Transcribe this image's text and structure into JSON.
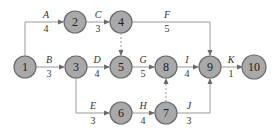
{
  "diagram": {
    "type": "activity-on-arrow network",
    "nodes": [
      {
        "id": "1",
        "x": 25,
        "y": 67
      },
      {
        "id": "2",
        "x": 75,
        "y": 22
      },
      {
        "id": "3",
        "x": 76,
        "y": 67
      },
      {
        "id": "4",
        "x": 121,
        "y": 22
      },
      {
        "id": "5",
        "x": 121,
        "y": 67
      },
      {
        "id": "6",
        "x": 121,
        "y": 113
      },
      {
        "id": "7",
        "x": 166,
        "y": 113
      },
      {
        "id": "8",
        "x": 166,
        "y": 67
      },
      {
        "id": "9",
        "x": 210,
        "y": 67
      },
      {
        "id": "10",
        "x": 254,
        "y": 67
      }
    ],
    "activities": [
      {
        "name": "A",
        "duration": "4",
        "from": "1",
        "to": "2"
      },
      {
        "name": "B",
        "duration": "3",
        "from": "1",
        "to": "3"
      },
      {
        "name": "C",
        "duration": "3",
        "from": "2",
        "to": "4"
      },
      {
        "name": "D",
        "duration": "4",
        "from": "3",
        "to": "5"
      },
      {
        "name": "E",
        "duration": "3",
        "from": "3",
        "to": "6"
      },
      {
        "name": "F",
        "duration": "5",
        "from": "4",
        "to": "9"
      },
      {
        "name": "G",
        "duration": "5",
        "from": "5",
        "to": "8"
      },
      {
        "name": "H",
        "duration": "4",
        "from": "6",
        "to": "7"
      },
      {
        "name": "I",
        "duration": "4",
        "from": "8",
        "to": "9"
      },
      {
        "name": "J",
        "duration": "3",
        "from": "7",
        "to": "9"
      },
      {
        "name": "K",
        "duration": "1",
        "from": "9",
        "to": "10"
      }
    ],
    "dummies": [
      {
        "from": "4",
        "to": "5"
      },
      {
        "from": "7",
        "to": "8"
      }
    ],
    "colors": {
      "node_fill": "#a9a9a9",
      "node_stroke": "#6a6a6a",
      "edge": "#9a9a9a"
    }
  }
}
